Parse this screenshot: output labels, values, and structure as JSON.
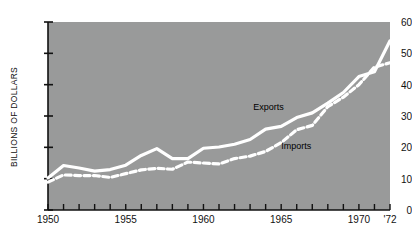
{
  "chart_data": {
    "type": "line",
    "title": "",
    "subtitle": "",
    "xlabel": "",
    "ylabel": "BILLIONS OF DOLLARS",
    "xlim": [
      1950,
      1972
    ],
    "ylim": [
      0,
      60
    ],
    "grid": false,
    "legend_position": "inline-annotation",
    "background_color": "#999a9a",
    "line_color": "#ffffff",
    "text_color": "#111111",
    "y_ticks": [
      0,
      10,
      20,
      30,
      40,
      50,
      60
    ],
    "y_tick_labels": [
      "0",
      "10",
      "20",
      "30",
      "40",
      "50",
      "60"
    ],
    "x_ticks": [
      1950,
      1951,
      1952,
      1953,
      1954,
      1955,
      1956,
      1957,
      1958,
      1959,
      1960,
      1961,
      1962,
      1963,
      1964,
      1965,
      1966,
      1967,
      1968,
      1969,
      1970,
      1971,
      1972
    ],
    "x_tick_labels": [
      {
        "value": 1950,
        "label": "1950"
      },
      {
        "value": 1955,
        "label": "1955"
      },
      {
        "value": 1960,
        "label": "1960"
      },
      {
        "value": 1965,
        "label": "1965"
      },
      {
        "value": 1970,
        "label": "1970"
      },
      {
        "value": 1972,
        "label": "'72"
      }
    ],
    "x": [
      1950,
      1951,
      1952,
      1953,
      1954,
      1955,
      1956,
      1957,
      1958,
      1959,
      1960,
      1961,
      1962,
      1963,
      1964,
      1965,
      1966,
      1967,
      1968,
      1969,
      1970,
      1971,
      1972
    ],
    "series": [
      {
        "name": "Exports",
        "style": "solid",
        "color": "#ffffff",
        "label_text": "Exports",
        "values": [
          10.2,
          14.2,
          13.4,
          12.4,
          12.9,
          14.3,
          17.4,
          19.6,
          16.4,
          16.4,
          19.7,
          20.1,
          21.0,
          22.5,
          25.8,
          26.7,
          29.5,
          31.0,
          34.1,
          37.5,
          42.6,
          44.1,
          54.0
        ]
      },
      {
        "name": "Imports",
        "style": "dashed",
        "color": "#ffffff",
        "label_text": "Imports",
        "values": [
          8.9,
          11.2,
          11.0,
          11.0,
          10.4,
          11.6,
          12.8,
          13.3,
          13.0,
          15.3,
          15.0,
          14.7,
          16.4,
          17.2,
          18.7,
          21.5,
          25.6,
          27.0,
          33.0,
          36.0,
          40.0,
          45.6,
          47.0
        ]
      }
    ],
    "annotations": [
      {
        "text": "Exports",
        "x": 1963.2,
        "y": 32.5
      },
      {
        "text": "Imports",
        "x": 1965.0,
        "y": 20.0
      }
    ]
  }
}
